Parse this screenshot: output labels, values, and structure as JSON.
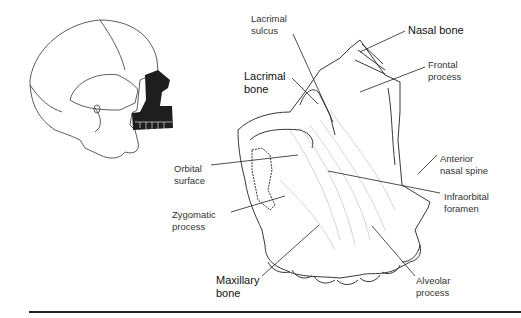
{
  "figure": {
    "skull_inset": {
      "highlighted_region": "maxillary bone",
      "highlight_color": "#1e1e1e"
    },
    "labels": [
      {
        "id": "lacrimal-sulcus",
        "text": "Lacrimal\nsulcus",
        "bold": false
      },
      {
        "id": "nasal-bone",
        "text": "Nasal bone",
        "bold": true
      },
      {
        "id": "lacrimal-bone",
        "text": "Lacrimal\nbone",
        "bold": true
      },
      {
        "id": "frontal-process",
        "text": "Frontal\nprocess",
        "bold": false
      },
      {
        "id": "orbital-surface",
        "text": "Orbital\nsurface",
        "bold": false
      },
      {
        "id": "anterior-nasal-spine",
        "text": "Anterior\nnasal spine",
        "bold": false
      },
      {
        "id": "infraorbital-foramen",
        "text": "Infraorbital\nforamen",
        "bold": false
      },
      {
        "id": "zygomatic-process",
        "text": "Zygomatic\nprocess",
        "bold": false
      },
      {
        "id": "maxillary-bone",
        "text": "Maxillary\nbone",
        "bold": true
      },
      {
        "id": "alveolar-process",
        "text": "Alveolar\nprocess",
        "bold": false
      }
    ]
  }
}
